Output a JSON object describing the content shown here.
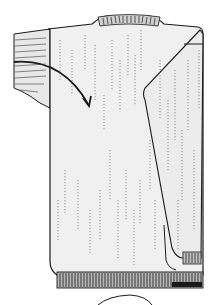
{
  "figure": {
    "colors": {
      "background": "#ffffff",
      "fabric": "#efefef",
      "outline": "#1a1a1a",
      "texture": "#555555",
      "ribbing": "#3a3a3a"
    }
  }
}
